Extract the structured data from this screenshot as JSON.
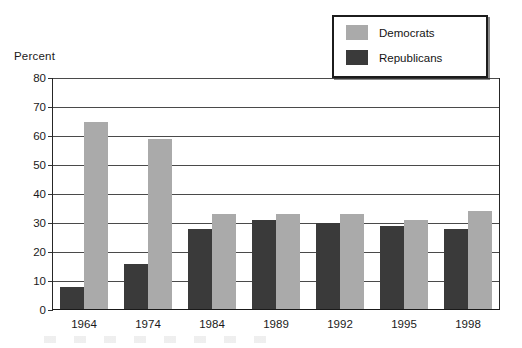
{
  "chart_data": {
    "type": "bar",
    "title": "",
    "xlabel": "",
    "ylabel": "Percent",
    "ylim": [
      0,
      80
    ],
    "ytick_step": 10,
    "yticks": [
      0,
      10,
      20,
      30,
      40,
      50,
      60,
      70,
      80
    ],
    "grid": true,
    "legend_position": "top-right",
    "categories": [
      "1964",
      "1974",
      "1984",
      "1989",
      "1992",
      "1995",
      "1998"
    ],
    "series": [
      {
        "name": "Republicans",
        "color": "#3a3a3a",
        "values": [
          8,
          16,
          28,
          31,
          30,
          29,
          28
        ]
      },
      {
        "name": "Democrats",
        "color": "#aaaaaa",
        "values": [
          65,
          59,
          33,
          33,
          33,
          31,
          34
        ]
      }
    ],
    "series_draw_order": [
      "Republicans",
      "Democrats"
    ]
  },
  "legend": {
    "items": [
      {
        "label": "Democrats",
        "swatch": "dem"
      },
      {
        "label": "Republicans",
        "swatch": "rep"
      }
    ]
  }
}
